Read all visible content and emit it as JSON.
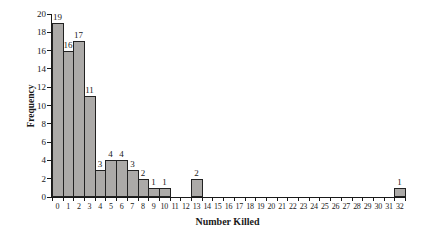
{
  "figure": {
    "background": "#ffffff"
  },
  "chart_data": {
    "type": "bar",
    "title": "",
    "xlabel": "Number Killed",
    "ylabel": "Frequency",
    "categories": [
      "0",
      "1",
      "2",
      "3",
      "4",
      "5",
      "6",
      "7",
      "8",
      "9",
      "10",
      "11",
      "12",
      "13",
      "14",
      "15",
      "16",
      "17",
      "18",
      "19",
      "20",
      "21",
      "22",
      "23",
      "24",
      "25",
      "26",
      "27",
      "28",
      "29",
      "30",
      "31",
      "32"
    ],
    "values": [
      19,
      16,
      17,
      11,
      3,
      4,
      4,
      3,
      2,
      1,
      1,
      0,
      0,
      2,
      0,
      0,
      0,
      0,
      0,
      0,
      0,
      0,
      0,
      0,
      0,
      0,
      0,
      0,
      0,
      0,
      0,
      0,
      1
    ],
    "value_labels_shown_for_nonzero_bars": [
      19,
      16,
      17,
      11,
      3,
      4,
      4,
      3,
      2,
      1,
      1,
      2,
      1
    ],
    "ylim": [
      0,
      20
    ],
    "ytick_step": 2,
    "yticks": [
      0,
      2,
      4,
      6,
      8,
      10,
      12,
      14,
      16,
      18,
      20
    ],
    "grid": false,
    "legend": "none",
    "bar_fill": "#acaaa8",
    "bar_border": "#222222",
    "axis_color": "#1a1a1a"
  }
}
